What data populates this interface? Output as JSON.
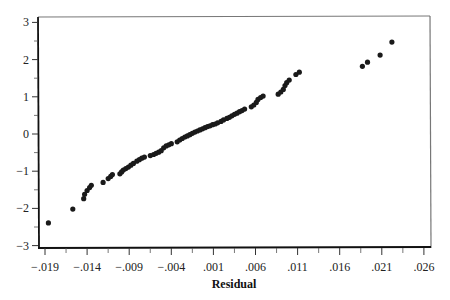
{
  "chart_data": {
    "type": "scatter",
    "title": "",
    "xlabel": "Residual",
    "ylabel": "",
    "xlim": [
      -0.0198,
      0.0265
    ],
    "ylim": [
      -3.05,
      3.2
    ],
    "grid": false,
    "legend": null,
    "x_ticks": [
      -0.019,
      -0.014,
      -0.009,
      -0.004,
      0.001,
      0.006,
      0.011,
      0.016,
      0.021,
      0.026
    ],
    "x_tick_labels": [
      "−.019",
      "−.014",
      "−.009",
      "−.004",
      ".001",
      ".006",
      ".011",
      ".016",
      ".021",
      ".026"
    ],
    "x_minor_ticks": [
      -0.0165,
      -0.0115,
      -0.0065,
      -0.0015,
      0.0035,
      0.0085,
      0.0135,
      0.0185,
      0.0235
    ],
    "y_ticks": [
      -3,
      -2,
      -1,
      0,
      1,
      2,
      3
    ],
    "y_tick_labels": [
      "−3",
      "−2",
      "−1",
      "0",
      "1",
      "2",
      "3"
    ],
    "y_minor_ticks": [
      -2.5,
      -1.5,
      -0.5,
      0.5,
      1.5,
      2.5
    ],
    "series": [
      {
        "name": "Normal probability plot of residuals",
        "color": "#1a1a1a",
        "points": [
          [
            -0.0186,
            -2.39
          ],
          [
            -0.0157,
            -2.02
          ],
          [
            -0.0144,
            -1.74
          ],
          [
            -0.0143,
            -1.62
          ],
          [
            -0.014,
            -1.52
          ],
          [
            -0.0137,
            -1.44
          ],
          [
            -0.0135,
            -1.38
          ],
          [
            -0.0121,
            -1.3
          ],
          [
            -0.0115,
            -1.2
          ],
          [
            -0.0112,
            -1.14
          ],
          [
            -0.011,
            -1.09
          ],
          [
            -0.0101,
            -1.07
          ],
          [
            -0.0099,
            -1.02
          ],
          [
            -0.0097,
            -0.97
          ],
          [
            -0.0094,
            -0.93
          ],
          [
            -0.0091,
            -0.89
          ],
          [
            -0.0088,
            -0.84
          ],
          [
            -0.0085,
            -0.79
          ],
          [
            -0.0081,
            -0.73
          ],
          [
            -0.0078,
            -0.69
          ],
          [
            -0.0075,
            -0.65
          ],
          [
            -0.0072,
            -0.62
          ],
          [
            -0.0065,
            -0.58
          ],
          [
            -0.0061,
            -0.55
          ],
          [
            -0.0058,
            -0.52
          ],
          [
            -0.0055,
            -0.49
          ],
          [
            -0.0052,
            -0.45
          ],
          [
            -0.0049,
            -0.37
          ],
          [
            -0.0046,
            -0.32
          ],
          [
            -0.0043,
            -0.29
          ],
          [
            -0.004,
            -0.26
          ],
          [
            -0.0033,
            -0.21
          ],
          [
            -0.003,
            -0.16
          ],
          [
            -0.0027,
            -0.12
          ],
          [
            -0.0024,
            -0.08
          ],
          [
            -0.0021,
            -0.05
          ],
          [
            -0.0018,
            -0.02
          ],
          [
            -0.0015,
            0.02
          ],
          [
            -0.0012,
            0.05
          ],
          [
            -0.0009,
            0.08
          ],
          [
            -0.0006,
            0.11
          ],
          [
            -0.0003,
            0.14
          ],
          [
            0.0,
            0.17
          ],
          [
            0.0003,
            0.2
          ],
          [
            0.0006,
            0.22
          ],
          [
            0.0009,
            0.25
          ],
          [
            0.0012,
            0.27
          ],
          [
            0.0015,
            0.3
          ],
          [
            0.0019,
            0.34
          ],
          [
            0.0022,
            0.38
          ],
          [
            0.0026,
            0.42
          ],
          [
            0.0029,
            0.45
          ],
          [
            0.0032,
            0.49
          ],
          [
            0.0035,
            0.53
          ],
          [
            0.0038,
            0.56
          ],
          [
            0.0041,
            0.6
          ],
          [
            0.0044,
            0.63
          ],
          [
            0.0047,
            0.67
          ],
          [
            0.0055,
            0.73
          ],
          [
            0.0058,
            0.78
          ],
          [
            0.0061,
            0.85
          ],
          [
            0.0063,
            0.93
          ],
          [
            0.0066,
            0.98
          ],
          [
            0.0069,
            1.02
          ],
          [
            0.0087,
            1.07
          ],
          [
            0.009,
            1.13
          ],
          [
            0.0093,
            1.2
          ],
          [
            0.0095,
            1.3
          ],
          [
            0.0097,
            1.38
          ],
          [
            0.01,
            1.45
          ],
          [
            0.0108,
            1.6
          ],
          [
            0.0112,
            1.66
          ],
          [
            0.0187,
            1.82
          ],
          [
            0.0193,
            1.93
          ],
          [
            0.0208,
            2.12
          ],
          [
            0.0222,
            2.47
          ]
        ]
      }
    ]
  }
}
